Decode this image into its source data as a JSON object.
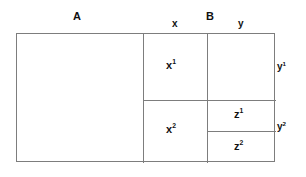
{
  "diagram": {
    "type": "nested-rectangle-partition",
    "canvas": {
      "width": 306,
      "height": 177,
      "background": "#ffffff"
    },
    "style": {
      "line_color": "#7d7d7d",
      "text_color": "#111111",
      "line_width_px": 1
    },
    "top_labels": {
      "a": "A",
      "x": "x",
      "b": "B",
      "y": "y"
    },
    "right_labels": {
      "y1": "y",
      "y1_sup": "1",
      "y2": "y",
      "y2_sup": "2"
    },
    "cells": {
      "a": {
        "label": "",
        "sup": ""
      },
      "x1": {
        "label": "x",
        "sup": "1"
      },
      "x2": {
        "label": "x",
        "sup": "2"
      },
      "y1": {
        "label": "",
        "sup": ""
      },
      "z1": {
        "label": "z",
        "sup": "1"
      },
      "z2": {
        "label": "z",
        "sup": "2"
      }
    }
  }
}
